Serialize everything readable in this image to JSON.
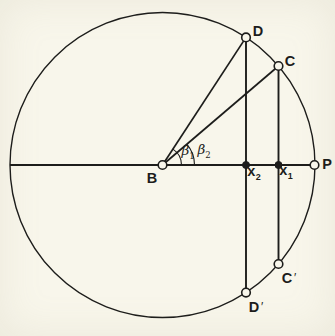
{
  "colors": {
    "paper": "#f8f6eb",
    "ink": "#1d1d1b"
  },
  "labels": {
    "D": {
      "text": "D",
      "x": 258,
      "y": 31
    },
    "C": {
      "text": "C",
      "x": 290,
      "y": 61
    },
    "B": {
      "text": "B",
      "x": 152,
      "y": 178
    },
    "P": {
      "text": "P",
      "x": 327,
      "y": 164
    },
    "x2": {
      "base": "x",
      "sub": "2",
      "x": 254,
      "y": 173
    },
    "x1": {
      "base": "x",
      "sub": "1",
      "x": 286,
      "y": 172
    },
    "beta1": {
      "base": "β",
      "sub": "1",
      "x": 188,
      "y": 152
    },
    "beta2": {
      "base": "β",
      "sub": "2",
      "x": 204,
      "y": 151
    },
    "C_prime": {
      "base": "C",
      "prime": "′",
      "x": 289,
      "y": 278
    },
    "D_prime": {
      "base": "D",
      "prime": "′",
      "x": 256,
      "y": 307
    }
  },
  "geometry": {
    "center": {
      "x": 162.5,
      "y": 165
    },
    "radius": 152.5,
    "points": {
      "axis_left": {
        "x": 10,
        "y": 165
      },
      "B": {
        "x": 162.5,
        "y": 165
      },
      "P": {
        "x": 314.5,
        "y": 165
      },
      "D": {
        "x": 246,
        "y": 37.4
      },
      "D_prime": {
        "x": 246,
        "y": 292.6
      },
      "C": {
        "x": 278.5,
        "y": 66
      },
      "C_prime": {
        "x": 278.5,
        "y": 264
      },
      "x2": {
        "x": 246,
        "y": 165
      },
      "x1": {
        "x": 278.5,
        "y": 165
      }
    },
    "arcs": {
      "beta1": {
        "radius": 19,
        "angle_deg": 56.8
      },
      "beta2": {
        "radius": 32,
        "angle_deg": 40.5
      }
    },
    "markers": [
      {
        "point": "B",
        "type": "open"
      },
      {
        "point": "D",
        "type": "open"
      },
      {
        "point": "C",
        "type": "open"
      },
      {
        "point": "P",
        "type": "open"
      },
      {
        "point": "C_prime",
        "type": "open"
      },
      {
        "point": "D_prime",
        "type": "open"
      },
      {
        "point": "x2",
        "type": "dot"
      },
      {
        "point": "x1",
        "type": "dot"
      }
    ]
  }
}
